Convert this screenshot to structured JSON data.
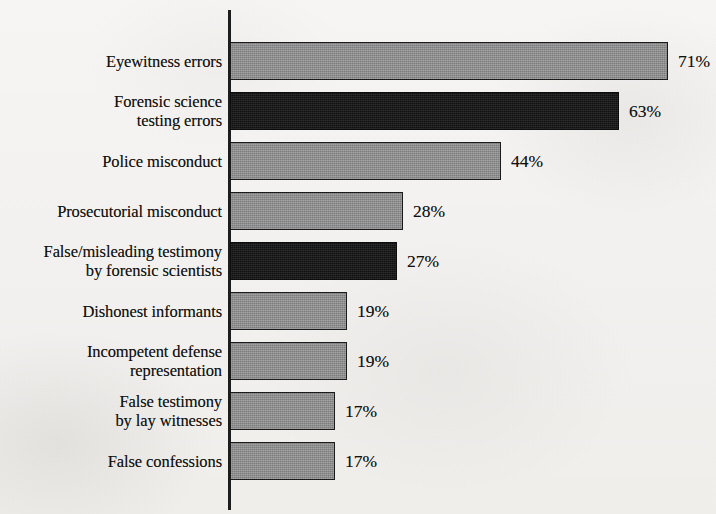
{
  "chart_data": {
    "type": "bar",
    "orientation": "horizontal",
    "title": "",
    "subtitle": "",
    "xlabel": "",
    "ylabel": "",
    "xlim": [
      0,
      71
    ],
    "grid": false,
    "legend": "none",
    "value_suffix": "%",
    "categories": [
      "Eyewitness errors",
      "Forensic science\ntesting errors",
      "Police misconduct",
      "Prosecutorial misconduct",
      "False/misleading testimony\nby forensic scientists",
      "Dishonest informants",
      "Incompetent defense\nrepresentation",
      "False testimony\nby lay witnesses",
      "False confessions"
    ],
    "values": [
      71,
      63,
      44,
      28,
      27,
      19,
      19,
      17,
      17
    ],
    "value_labels": [
      "71%",
      "63%",
      "44%",
      "28%",
      "27%",
      "19%",
      "19%",
      "17%",
      "17%"
    ],
    "bar_colors": [
      "#8e8e8e",
      "#191919",
      "#8e8e8e",
      "#8e8e8e",
      "#191919",
      "#8e8e8e",
      "#8e8e8e",
      "#8e8e8e",
      "#8e8e8e"
    ],
    "bars": [
      {
        "label": "Eyewitness errors",
        "value": 71,
        "value_label": "71%",
        "style": "gray"
      },
      {
        "label": "Forensic science\ntesting errors",
        "value": 63,
        "value_label": "63%",
        "style": "black"
      },
      {
        "label": "Police misconduct",
        "value": 44,
        "value_label": "44%",
        "style": "gray"
      },
      {
        "label": "Prosecutorial misconduct",
        "value": 28,
        "value_label": "28%",
        "style": "gray"
      },
      {
        "label": "False/misleading testimony\nby forensic scientists",
        "value": 27,
        "value_label": "27%",
        "style": "black"
      },
      {
        "label": "Dishonest informants",
        "value": 19,
        "value_label": "19%",
        "style": "gray"
      },
      {
        "label": "Incompetent defense\nrepresentation",
        "value": 19,
        "value_label": "19%",
        "style": "gray"
      },
      {
        "label": "False testimony\nby lay witnesses",
        "value": 17,
        "value_label": "17%",
        "style": "gray"
      },
      {
        "label": "False confessions",
        "value": 17,
        "value_label": "17%",
        "style": "gray"
      }
    ]
  },
  "colors": {
    "paper_background": "#f3f2f0",
    "axis": "#1d1d1d",
    "bar_gray": "#8e8e8e",
    "bar_black": "#191919",
    "bar_outline": "#1b1b1b",
    "text": "#111111"
  },
  "geometry": {
    "axis_x": 230,
    "axis_top": 10,
    "axis_bottom": 510,
    "first_bar_top": 42,
    "bar_height": 38,
    "bar_pitch": 50,
    "px_per_percent": 6.17,
    "value_gap": 10
  }
}
